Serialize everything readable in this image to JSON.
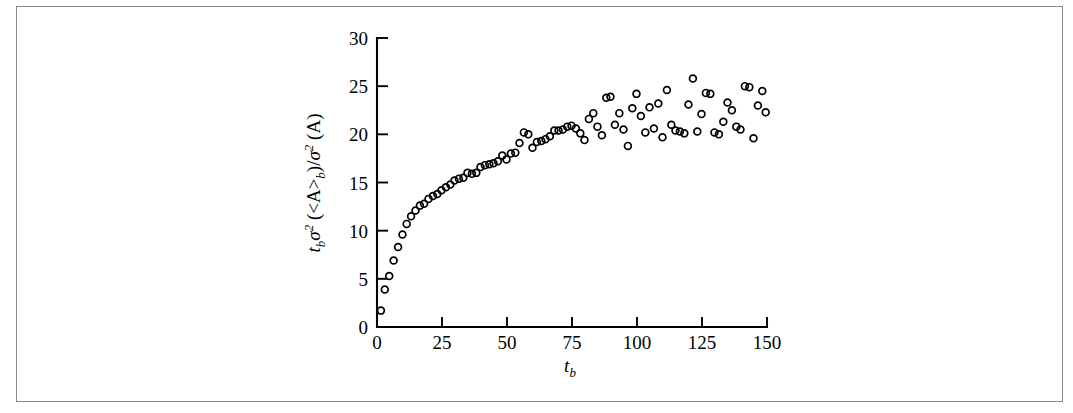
{
  "figure": {
    "frame_border_color": "#8a8a8a",
    "background_color": "#ffffff",
    "marker_color": "#000000"
  },
  "chart_data": {
    "type": "scatter",
    "title": "",
    "subtitle": "",
    "xlabel": "t_b",
    "ylabel": "t_b σ² (<A>_b)/σ² (A)",
    "xlabel_parts": {
      "base": "t",
      "sub": "b"
    },
    "ylabel_parts": {
      "p1_base": "t",
      "p1_sub": "b",
      "p2_base": "σ",
      "p2_sup": "2",
      "p3": " (<A>",
      "p3_sub": "b",
      "p4": ")/",
      "p5_base": "σ",
      "p5_sup": "2",
      "p6": " (A)"
    },
    "xlim": [
      0,
      150
    ],
    "ylim": [
      0,
      30
    ],
    "xticks": [
      0,
      25,
      50,
      75,
      100,
      125,
      150
    ],
    "yticks": [
      0,
      5,
      10,
      15,
      20,
      25,
      30
    ],
    "xtick_labels": [
      "0",
      "25",
      "50",
      "75",
      "100",
      "125",
      "150"
    ],
    "ytick_labels": [
      "0",
      "5",
      "10",
      "15",
      "20",
      "25",
      "30"
    ],
    "grid": false,
    "legend": null,
    "marker_style": "open-circle",
    "marker_radius": 3.4,
    "series": [
      {
        "name": "variance ratio",
        "points": [
          [
            1.5,
            1.7
          ],
          [
            3.0,
            3.9
          ],
          [
            4.7,
            5.3
          ],
          [
            6.4,
            6.9
          ],
          [
            8.1,
            8.3
          ],
          [
            9.8,
            9.6
          ],
          [
            11.4,
            10.7
          ],
          [
            13.1,
            11.5
          ],
          [
            14.8,
            12.1
          ],
          [
            16.5,
            12.6
          ],
          [
            18.1,
            12.8
          ],
          [
            19.8,
            13.3
          ],
          [
            21.5,
            13.6
          ],
          [
            23.2,
            13.8
          ],
          [
            24.8,
            14.2
          ],
          [
            26.5,
            14.5
          ],
          [
            28.2,
            14.8
          ],
          [
            29.8,
            15.2
          ],
          [
            31.5,
            15.4
          ],
          [
            33.2,
            15.5
          ],
          [
            34.8,
            16.0
          ],
          [
            36.5,
            15.9
          ],
          [
            38.2,
            16.0
          ],
          [
            39.8,
            16.6
          ],
          [
            41.5,
            16.8
          ],
          [
            43.2,
            16.9
          ],
          [
            44.8,
            17.0
          ],
          [
            46.5,
            17.2
          ],
          [
            48.2,
            17.8
          ],
          [
            49.8,
            17.4
          ],
          [
            51.5,
            18.0
          ],
          [
            53.2,
            18.1
          ],
          [
            54.8,
            19.1
          ],
          [
            56.5,
            20.2
          ],
          [
            58.2,
            20.0
          ],
          [
            59.8,
            18.6
          ],
          [
            61.5,
            19.2
          ],
          [
            63.2,
            19.3
          ],
          [
            64.8,
            19.5
          ],
          [
            66.5,
            19.8
          ],
          [
            68.2,
            20.4
          ],
          [
            69.8,
            20.4
          ],
          [
            71.5,
            20.5
          ],
          [
            73.2,
            20.8
          ],
          [
            74.8,
            20.9
          ],
          [
            76.5,
            20.6
          ],
          [
            78.2,
            20.1
          ],
          [
            79.8,
            19.4
          ],
          [
            81.5,
            21.6
          ],
          [
            83.2,
            22.2
          ],
          [
            84.8,
            20.8
          ],
          [
            86.5,
            19.9
          ],
          [
            88.2,
            23.8
          ],
          [
            89.8,
            23.9
          ],
          [
            91.5,
            21.0
          ],
          [
            93.2,
            22.2
          ],
          [
            94.8,
            20.5
          ],
          [
            96.5,
            18.8
          ],
          [
            98.2,
            22.7
          ],
          [
            99.8,
            24.2
          ],
          [
            101.5,
            21.9
          ],
          [
            103.2,
            20.2
          ],
          [
            104.8,
            22.8
          ],
          [
            106.5,
            20.6
          ],
          [
            108.2,
            23.2
          ],
          [
            109.8,
            19.7
          ],
          [
            111.5,
            24.6
          ],
          [
            113.2,
            21.0
          ],
          [
            114.8,
            20.4
          ],
          [
            116.5,
            20.3
          ],
          [
            118.2,
            20.1
          ],
          [
            119.8,
            23.1
          ],
          [
            121.5,
            25.8
          ],
          [
            123.2,
            20.3
          ],
          [
            124.8,
            22.1
          ],
          [
            126.5,
            24.3
          ],
          [
            128.2,
            24.2
          ],
          [
            129.8,
            20.2
          ],
          [
            131.5,
            20.0
          ],
          [
            133.2,
            21.3
          ],
          [
            134.8,
            23.3
          ],
          [
            136.5,
            22.5
          ],
          [
            138.2,
            20.8
          ],
          [
            139.8,
            20.5
          ],
          [
            141.5,
            25.0
          ],
          [
            143.2,
            24.9
          ],
          [
            144.8,
            19.6
          ],
          [
            146.5,
            23.0
          ],
          [
            148.2,
            24.5
          ],
          [
            149.5,
            22.3
          ]
        ]
      }
    ]
  }
}
